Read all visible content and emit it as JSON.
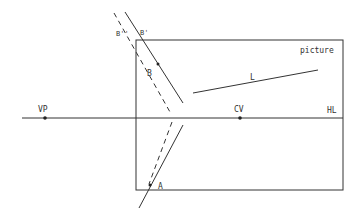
{
  "diagram": {
    "picture_label": "picture",
    "horizon_label": "HL",
    "vanishing_point_label": "VP",
    "center_of_vision_label": "CV",
    "line_label": "L",
    "point_a_label": "A",
    "point_b_label": "B",
    "point_b_prime_label": "B'",
    "point_b_double_prime_label": "B''"
  },
  "colors": {
    "line": "#333333",
    "background": "#ffffff"
  }
}
